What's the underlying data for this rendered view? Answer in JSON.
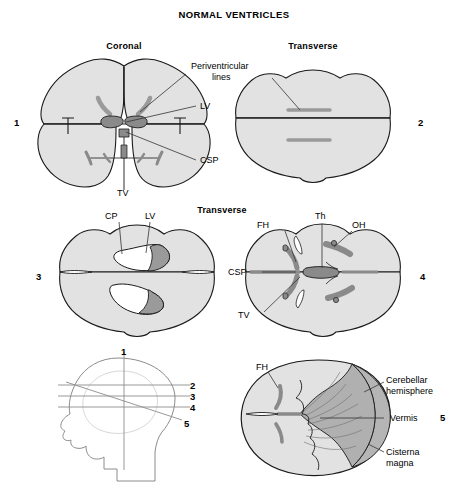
{
  "figure": {
    "title": "NORMAL VENTRICLES",
    "background_color": "#ffffff",
    "brain_fill": "#e2e2e2",
    "brain_stroke": "#1a1a1a",
    "ventricle_fill": "#9a9a9a",
    "ventricle_dark_fill": "#8a8a8a",
    "cerebellum_fill": "#b5b5b5",
    "head_stroke": "#8c8c8c",
    "leader_stroke": "#333333"
  },
  "section_headings": {
    "coronal": "Coronal",
    "transverse_top": "Transverse",
    "transverse_mid": "Transverse"
  },
  "panels": [
    {
      "id": 1,
      "number": "1",
      "plane": "Coronal",
      "labels": [
        {
          "key": "periventricular_lines",
          "text_line1": "Periventricular",
          "text_line2": "lines"
        },
        {
          "key": "lv",
          "text": "LV"
        },
        {
          "key": "csp",
          "text": "CSP"
        },
        {
          "key": "tv",
          "text": "TV"
        }
      ]
    },
    {
      "id": 2,
      "number": "2",
      "plane": "Transverse",
      "labels": [
        {
          "key": "periventricular_lines",
          "text": "Periventricular lines"
        }
      ]
    },
    {
      "id": 3,
      "number": "3",
      "plane": "Transverse",
      "labels": [
        {
          "key": "cp",
          "text": "CP"
        },
        {
          "key": "lv",
          "text": "LV"
        }
      ]
    },
    {
      "id": 4,
      "number": "4",
      "plane": "Transverse",
      "labels": [
        {
          "key": "fh",
          "text": "FH"
        },
        {
          "key": "th",
          "text": "Th"
        },
        {
          "key": "oh",
          "text": "OH"
        },
        {
          "key": "csp",
          "text": "CSP"
        },
        {
          "key": "tv",
          "text": "TV"
        }
      ]
    },
    {
      "id": 5,
      "number": "5",
      "plane": "Transverse",
      "labels": [
        {
          "key": "fh",
          "text": "FH"
        },
        {
          "key": "cerebellar_hemisphere_l1",
          "text": "Cerebellar"
        },
        {
          "key": "cerebellar_hemisphere_l2",
          "text": "hemisphere"
        },
        {
          "key": "vermis",
          "text": "Vermis"
        },
        {
          "key": "cisterna_magna_l1",
          "text": "Cisterna"
        },
        {
          "key": "cisterna_magna_l2",
          "text": "magna"
        }
      ]
    }
  ],
  "head_diagram": {
    "name": "scan-plane-reference-head",
    "plane_markers": [
      "1",
      "2",
      "3",
      "4",
      "5"
    ]
  },
  "abbreviations": {
    "LV": "LV",
    "CSP": "CSP",
    "TV": "TV",
    "CP": "CP",
    "FH": "FH",
    "Th": "Th",
    "OH": "OH"
  }
}
